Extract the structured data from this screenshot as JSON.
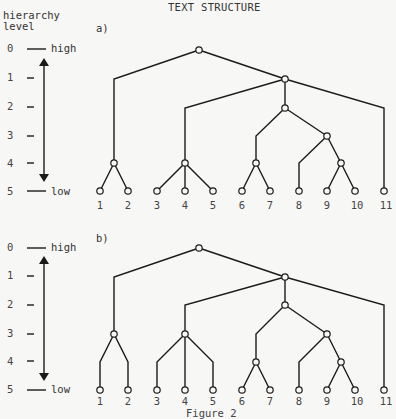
{
  "title": "TEXT STRUCTURE",
  "axis": {
    "caption_line1": "hierarchy",
    "caption_line2": "level",
    "levels": [
      "0",
      "1",
      "2",
      "3",
      "4",
      "5"
    ],
    "high_label": "high",
    "low_label": "low"
  },
  "panels": [
    {
      "label": "a)",
      "leaves": [
        "1",
        "2",
        "3",
        "4",
        "5",
        "6",
        "7",
        "8",
        "9",
        "10",
        "11"
      ]
    },
    {
      "label": "b)",
      "leaves": [
        "1",
        "2",
        "3",
        "4",
        "5",
        "6",
        "7",
        "8",
        "9",
        "10",
        "11"
      ]
    }
  ],
  "caption": "Figure 2",
  "colors": {
    "ink": "#1a1a1a",
    "background": "#f7f7f5"
  }
}
